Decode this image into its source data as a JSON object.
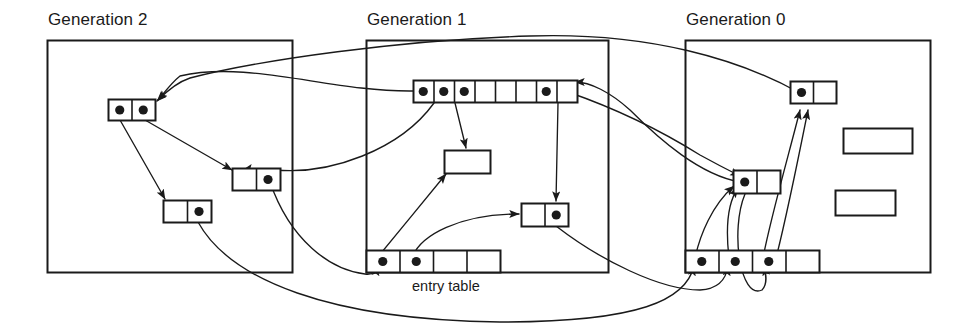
{
  "diagram": {
    "type": "memory-object-graph",
    "background": "#ffffff",
    "stroke": "#1a1a1a",
    "generations": [
      {
        "id": "generation-2",
        "label": "Generation 2",
        "label_x": 48,
        "label_y": 10,
        "box": {
          "x": 47,
          "y": 40,
          "w": 245,
          "h": 232
        },
        "has_entry_table": false
      },
      {
        "id": "generation-1",
        "label": "Generation 1",
        "label_x": 367,
        "label_y": 10,
        "box": {
          "x": 366,
          "y": 40,
          "w": 242,
          "h": 232
        },
        "has_entry_table": true,
        "entry_table_label": "entry table",
        "entry_label_x": 412,
        "entry_label_y": 278
      },
      {
        "id": "generation-0",
        "label": "Generation 0",
        "label_x": 686,
        "label_y": 10,
        "box": {
          "x": 685,
          "y": 40,
          "w": 245,
          "h": 232
        },
        "has_entry_table": false
      }
    ],
    "nodes": [
      {
        "id": "g2-node-a",
        "gen": "generation-2",
        "x": 108,
        "y": 99,
        "cell_w": 23.5,
        "cell_h": 21,
        "cells": [
          true,
          true
        ]
      },
      {
        "id": "g2-node-b",
        "gen": "generation-2",
        "x": 232,
        "y": 168,
        "cell_w": 24,
        "cell_h": 22,
        "cells": [
          false,
          true
        ]
      },
      {
        "id": "g2-node-c",
        "gen": "generation-2",
        "x": 163,
        "y": 200,
        "cell_w": 24,
        "cell_h": 22,
        "cells": [
          false,
          true
        ]
      },
      {
        "id": "g1-array",
        "gen": "generation-1",
        "x": 413,
        "y": 80,
        "cell_w": 20.5,
        "cell_h": 22,
        "cells": [
          true,
          true,
          true,
          false,
          false,
          false,
          true,
          false
        ]
      },
      {
        "id": "g1-empty-box",
        "gen": "generation-1",
        "x": 444,
        "y": 150,
        "cell_w": 46,
        "cell_h": 23,
        "cells": [
          false
        ]
      },
      {
        "id": "g1-node-d",
        "gen": "generation-1",
        "x": 521,
        "y": 203,
        "cell_w": 23.5,
        "cell_h": 23,
        "cells": [
          false,
          true
        ]
      },
      {
        "id": "g1-entry-table",
        "gen": "generation-1",
        "x": 366,
        "y": 250,
        "cell_w": 33.5,
        "cell_h": 22,
        "cells": [
          true,
          true,
          false,
          false
        ]
      },
      {
        "id": "g0-node-e",
        "gen": "generation-0",
        "x": 790,
        "y": 81,
        "cell_w": 23,
        "cell_h": 22,
        "cells": [
          true,
          false
        ]
      },
      {
        "id": "g0-node-f",
        "gen": "generation-0",
        "x": 733,
        "y": 170,
        "cell_w": 23.5,
        "cell_h": 23,
        "cells": [
          true,
          false
        ]
      },
      {
        "id": "g0-empty-box-1",
        "gen": "generation-0",
        "x": 843,
        "y": 128,
        "cell_w": 69,
        "cell_h": 25,
        "cells": [
          false
        ]
      },
      {
        "id": "g0-empty-box-2",
        "gen": "generation-0",
        "x": 835,
        "y": 190,
        "cell_w": 60,
        "cell_h": 25,
        "cells": [
          false
        ]
      },
      {
        "id": "g0-entry-table",
        "gen": "generation-0",
        "x": 685,
        "y": 250,
        "cell_w": 33.5,
        "cell_h": 22,
        "cells": [
          true,
          true,
          true,
          false
        ]
      }
    ],
    "pointers": [
      {
        "id": "p-g1a0-to-g2a",
        "path": "M 413 91 C 330 92, 250 60, 180 76, 170 84, 162 96, 157 101",
        "from": "g1-array cell 1",
        "to": "g2-node-a"
      },
      {
        "id": "p-g2a-left-to-g2c",
        "path": "M 120 120 L 165 199",
        "from": "g2-node-a left cell",
        "to": "g2-node-c"
      },
      {
        "id": "p-g2a-right-to-g2b",
        "path": "M 145 120 L 232 170",
        "from": "g2-node-a right cell",
        "to": "g2-node-b"
      },
      {
        "id": "p-g1a1-to-g2b",
        "path": "M 434 103 C 400 150, 330 175, 275 170, 265 169, 252 168, 243 170",
        "from": "g1-array cell 2",
        "to": "g2-node-b"
      },
      {
        "id": "p-g1a2-to-g1empty",
        "path": "M 455 103 L 466 148",
        "from": "g1-array cell 3",
        "to": "g1-empty-box"
      },
      {
        "id": "p-g1a6-to-g1d",
        "path": "M 558 103 L 556 201",
        "from": "g1-array cell 7",
        "to": "g1-node-d"
      },
      {
        "id": "p-g1e0-to-g1empty",
        "path": "M 377 258 C 396 235, 428 196, 446 174",
        "from": "g1-entry-table cell 1",
        "to": "g1-empty-box"
      },
      {
        "id": "p-g1e1-to-g1d",
        "path": "M 412 258 C 420 235, 460 214, 519 214",
        "from": "g1-entry-table cell 2",
        "to": "g1-node-d"
      },
      {
        "id": "p-g2b-to-g1e0",
        "path": "M 270 182 C 290 240, 330 270, 365 274, 372 275, 376 272, 377 266",
        "from": "g2-node-b right cell",
        "to": "g1-entry-table cell 1"
      },
      {
        "id": "p-g0a-to-g2a",
        "path": "M 798 92 C 740 60, 650 32, 530 36, 400 40, 260 60, 190 78, 175 83, 164 94, 158 100",
        "from": "g0-node-e left cell",
        "to": "g2-node-a"
      },
      {
        "id": "p-g0f-to-g1a",
        "path": "M 740 182 C 700 175, 660 140, 630 110, 610 92, 590 82, 575 82",
        "from": "g0-node-f left cell",
        "to": "g1-array"
      },
      {
        "id": "p-g1a6b-to-g0f",
        "path": "M 568 92 C 620 110, 660 130, 700 155, 720 166, 732 172, 740 176",
        "from": "g1-array cell 7",
        "to": "g0-node-f"
      },
      {
        "id": "p-g0e0-to-g0f",
        "path": "M 695 258 C 700 235, 712 205, 734 186",
        "from": "g0-entry-table cell 1",
        "to": "g0-node-f"
      },
      {
        "id": "p-g0e1-to-g0f",
        "path": "M 729 258 C 726 232, 726 205, 738 188",
        "from": "g0-entry-table cell 2",
        "to": "g0-node-f"
      },
      {
        "id": "p-g0e2-to-g0e",
        "path": "M 763 258 C 770 220, 790 150, 800 110",
        "from": "g0-entry-table cell 3",
        "to": "g0-node-e"
      },
      {
        "id": "p-g0e2b-to-g0e",
        "path": "M 775 262 C 786 220, 800 150, 808 110",
        "from": "g0-entry-table cell 3",
        "to": "g0-node-e"
      },
      {
        "id": "p-g2c-to-g0e0",
        "path": "M 198 222 C 230 280, 330 320, 500 322, 640 322, 686 300, 694 266",
        "from": "g2-node-c right cell",
        "to": "g0-entry-table cell 1"
      },
      {
        "id": "p-g1d-to-g0e1",
        "path": "M 556 226 C 600 260, 660 290, 700 290, 718 289, 726 280, 728 266",
        "from": "g1-node-d right cell",
        "to": "g0-entry-table cell 2"
      },
      {
        "id": "p-g0f-to-g0e2",
        "path": "M 745 194 C 730 230, 740 300, 762 290, 768 284, 766 274, 764 266",
        "from": "g0-node-f",
        "to": "g0-entry-table cell 3"
      }
    ]
  }
}
